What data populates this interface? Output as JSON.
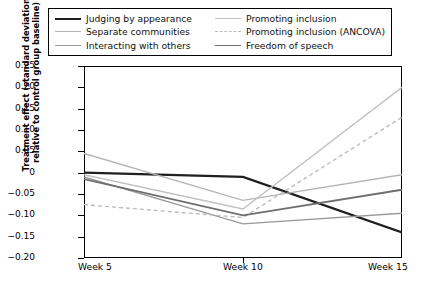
{
  "legend": {
    "entries": [
      {
        "label": "Judging by appearance",
        "color": "#1f1f1f",
        "style": "solid",
        "width": 2.2
      },
      {
        "label": "Separate communities",
        "color": "#b4b4b4",
        "style": "solid",
        "width": 1.5
      },
      {
        "label": "Interacting with others",
        "color": "#9a9a9a",
        "style": "solid",
        "width": 1.5
      },
      {
        "label": "Promoting inclusion",
        "color": "#c0c0c0",
        "style": "solid",
        "width": 1.5
      },
      {
        "label": "Promoting inclusion (ANCOVA)",
        "color": "#bdbdbd",
        "style": "dashed",
        "width": 1.5
      },
      {
        "label": "Freedom of speech",
        "color": "#6e6e6e",
        "style": "solid",
        "width": 1.8
      }
    ]
  },
  "axes": {
    "ylabel": "Treatment effect (standard deviations relative to control group baseline)",
    "yticks": [
      "0.25",
      "0.20",
      "0.15",
      "0.10",
      "0.05",
      "0",
      "−0.05",
      "−0.10",
      "−0.15",
      "−0.20"
    ],
    "ytick_values": [
      0.25,
      0.2,
      0.15,
      0.1,
      0.05,
      0,
      -0.05,
      -0.1,
      -0.15,
      -0.2
    ],
    "xticks": [
      "Week 5",
      "Week 10",
      "Week 15"
    ]
  },
  "chart_data": {
    "type": "line",
    "title": "",
    "xlabel": "",
    "ylabel": "Treatment effect (standard deviations relative to control group baseline)",
    "x": [
      "Week 5",
      "Week 10",
      "Week 15"
    ],
    "ylim": [
      -0.2,
      0.25
    ],
    "ytick_step": 0.05,
    "grid": false,
    "legend_position": "top",
    "series": [
      {
        "name": "Judging by appearance",
        "color": "#1f1f1f",
        "style": "solid",
        "values": [
          0.0,
          -0.01,
          -0.14
        ]
      },
      {
        "name": "Separate communities",
        "color": "#b4b4b4",
        "style": "solid",
        "values": [
          0.045,
          -0.065,
          -0.005
        ]
      },
      {
        "name": "Interacting with others",
        "color": "#9a9a9a",
        "style": "solid",
        "values": [
          -0.01,
          -0.12,
          -0.095
        ]
      },
      {
        "name": "Promoting inclusion",
        "color": "#c0c0c0",
        "style": "solid",
        "values": [
          -0.005,
          -0.085,
          0.2
        ]
      },
      {
        "name": "Promoting inclusion (ANCOVA)",
        "color": "#bdbdbd",
        "style": "dashed",
        "values": [
          -0.075,
          -0.105,
          0.13
        ]
      },
      {
        "name": "Freedom of speech",
        "color": "#6e6e6e",
        "style": "solid",
        "values": [
          -0.015,
          -0.1,
          -0.04
        ]
      }
    ]
  }
}
